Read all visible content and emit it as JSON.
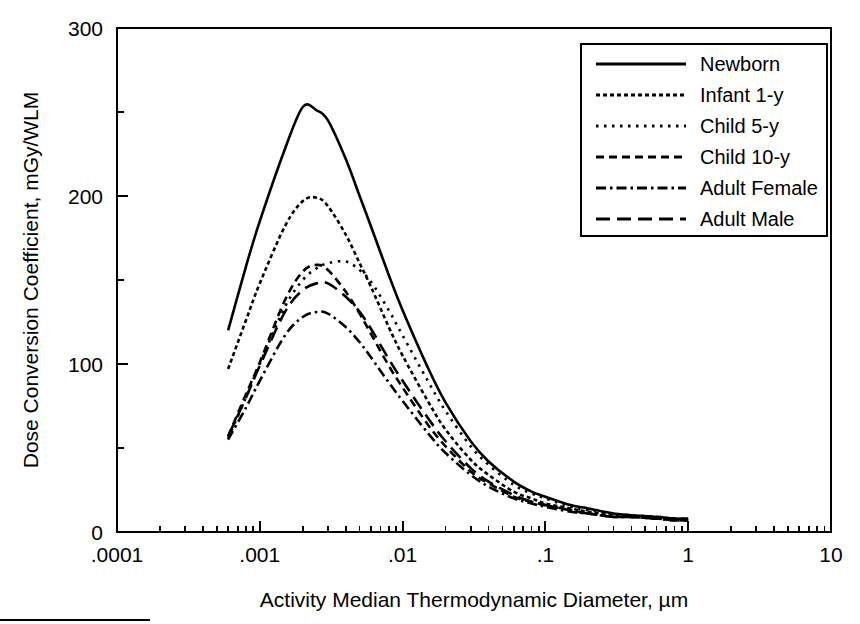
{
  "chart_data": {
    "type": "line",
    "title": "",
    "xlabel": "Activity Median Thermodynamic Diameter, µm",
    "ylabel": "Dose Conversion Coefficient, mGy/WLM",
    "xscale": "log",
    "yscale": "linear",
    "xlim": [
      0.0001,
      10
    ],
    "ylim": [
      0,
      300
    ],
    "grid": false,
    "x_major_ticks": [
      0.0001,
      0.001,
      0.01,
      0.1,
      1,
      10
    ],
    "x_major_tick_labels": [
      ".0001",
      ".001",
      ".01",
      ".1",
      "1",
      "10"
    ],
    "y_major_ticks": [
      0,
      100,
      200,
      300
    ],
    "y_major_tick_labels": [
      "0",
      "100",
      "200",
      "300"
    ],
    "y_minor_ticks": [
      50,
      150,
      250
    ],
    "legend_position": "top-right",
    "series": [
      {
        "name": "Newborn",
        "linestyle": "solid",
        "dash": "none",
        "peak_x": 0.002,
        "peak_y": 253,
        "x": [
          0.0006,
          0.0008,
          0.001,
          0.0015,
          0.002,
          0.0025,
          0.003,
          0.004,
          0.005,
          0.006,
          0.008,
          0.01,
          0.015,
          0.02,
          0.03,
          0.04,
          0.06,
          0.08,
          0.1,
          0.15,
          0.2,
          0.3,
          0.4,
          0.6,
          0.8,
          1.0
        ],
        "y": [
          120,
          158,
          185,
          228,
          253,
          251,
          245,
          222,
          200,
          182,
          153,
          132,
          98,
          77,
          54,
          42,
          30,
          24,
          21,
          16,
          14,
          11,
          10,
          9,
          8,
          8
        ]
      },
      {
        "name": "Infant 1-y",
        "linestyle": "fine-dotted",
        "dash": "4,3",
        "peak_x": 0.0022,
        "peak_y": 199,
        "x": [
          0.0006,
          0.0008,
          0.001,
          0.0015,
          0.002,
          0.0025,
          0.003,
          0.004,
          0.005,
          0.006,
          0.008,
          0.01,
          0.015,
          0.02,
          0.03,
          0.04,
          0.06,
          0.08,
          0.1,
          0.15,
          0.2,
          0.3,
          0.4,
          0.6,
          0.8,
          1.0
        ],
        "y": [
          97,
          126,
          148,
          182,
          197,
          199,
          194,
          177,
          160,
          146,
          122,
          105,
          78,
          61,
          43,
          34,
          24,
          20,
          17,
          14,
          12,
          10,
          9,
          8,
          8,
          7
        ]
      },
      {
        "name": "Child 5-y",
        "linestyle": "dotted",
        "dash": "2,5",
        "peak_x": 0.004,
        "peak_y": 161,
        "x": [
          0.0006,
          0.0008,
          0.001,
          0.0015,
          0.002,
          0.0025,
          0.003,
          0.004,
          0.005,
          0.006,
          0.008,
          0.01,
          0.015,
          0.02,
          0.03,
          0.04,
          0.06,
          0.08,
          0.1,
          0.15,
          0.2,
          0.3,
          0.4,
          0.6,
          0.8,
          1.0
        ],
        "y": [
          56,
          80,
          100,
          134,
          150,
          157,
          160,
          161,
          156,
          149,
          132,
          117,
          90,
          72,
          51,
          40,
          28,
          23,
          20,
          15,
          13,
          11,
          10,
          9,
          8,
          8
        ]
      },
      {
        "name": "Child 10-y",
        "linestyle": "dashed",
        "dash": "7,4",
        "peak_x": 0.0023,
        "peak_y": 159,
        "x": [
          0.0006,
          0.0008,
          0.001,
          0.0015,
          0.002,
          0.0025,
          0.003,
          0.004,
          0.005,
          0.006,
          0.008,
          0.01,
          0.015,
          0.02,
          0.03,
          0.04,
          0.06,
          0.08,
          0.1,
          0.15,
          0.2,
          0.3,
          0.4,
          0.6,
          0.8,
          1.0
        ],
        "y": [
          57,
          82,
          101,
          138,
          155,
          159,
          156,
          143,
          130,
          118,
          99,
          86,
          64,
          51,
          36,
          29,
          21,
          18,
          16,
          13,
          11,
          9,
          9,
          8,
          7,
          7
        ]
      },
      {
        "name": "Adult Female",
        "linestyle": "dash-dot",
        "dash": "9,4,2,4",
        "peak_x": 0.0026,
        "peak_y": 131,
        "x": [
          0.0006,
          0.0008,
          0.001,
          0.0015,
          0.002,
          0.0025,
          0.003,
          0.004,
          0.005,
          0.006,
          0.008,
          0.01,
          0.015,
          0.02,
          0.03,
          0.04,
          0.06,
          0.08,
          0.1,
          0.15,
          0.2,
          0.3,
          0.4,
          0.6,
          0.8,
          1.0
        ],
        "y": [
          55,
          74,
          90,
          117,
          128,
          131,
          130,
          122,
          113,
          104,
          89,
          78,
          59,
          47,
          34,
          27,
          20,
          17,
          15,
          12,
          11,
          9,
          9,
          8,
          7,
          7
        ]
      },
      {
        "name": "Adult Male",
        "linestyle": "long-dash",
        "dash": "12,6",
        "peak_x": 0.0028,
        "peak_y": 148,
        "x": [
          0.0006,
          0.0008,
          0.001,
          0.0015,
          0.002,
          0.0025,
          0.003,
          0.004,
          0.005,
          0.006,
          0.008,
          0.01,
          0.015,
          0.02,
          0.03,
          0.04,
          0.06,
          0.08,
          0.1,
          0.15,
          0.2,
          0.3,
          0.4,
          0.6,
          0.8,
          1.0
        ],
        "y": [
          57,
          80,
          99,
          131,
          144,
          148,
          148,
          140,
          131,
          121,
          103,
          90,
          68,
          54,
          38,
          30,
          22,
          18,
          16,
          13,
          11,
          9,
          9,
          8,
          7,
          7
        ]
      }
    ]
  },
  "axes": {
    "x_title": "Activity Median Thermodynamic Diameter, µm",
    "y_title": "Dose Conversion Coefficient, mGy/WLM",
    "x_tick_labels": [
      ".0001",
      ".001",
      ".01",
      ".1",
      "1",
      "10"
    ],
    "y_tick_labels": [
      "0",
      "100",
      "200",
      "300"
    ]
  },
  "legend": {
    "entries": [
      {
        "label": "Newborn",
        "style": "solid"
      },
      {
        "label": "Infant 1-y",
        "style": "fine-dotted"
      },
      {
        "label": "Child 5-y",
        "style": "dotted"
      },
      {
        "label": "Child 10-y",
        "style": "dashed"
      },
      {
        "label": "Adult Female",
        "style": "dash-dot"
      },
      {
        "label": "Adult Male",
        "style": "long-dash"
      }
    ]
  },
  "colors": {
    "ink": "#000000",
    "paper": "#ffffff"
  }
}
